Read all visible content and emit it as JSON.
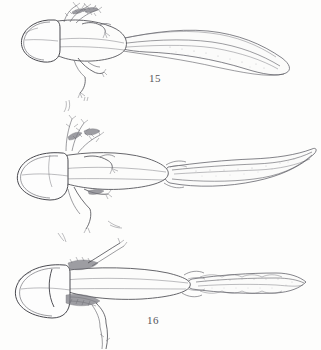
{
  "plate": {
    "title": "Plate of larval amphibian specimens, dorsal view",
    "background_color": "#fdfdfc",
    "ink_color": "#4a4a50",
    "caption_color": "#55555a",
    "width": 321,
    "height": 350
  },
  "figures": [
    {
      "number": "15",
      "caption": "15",
      "subject": "larval salamander, dorsal view",
      "orientation": "head at left, tail extending to upper right",
      "features": [
        "rounded broad head",
        "paired feathery external gills above forelimb",
        "forelimb with digits",
        "hind limb with digits directed downward",
        "long tapering tail with dorsal and ventral fin",
        "stippled shading along tail fin"
      ],
      "head_position": "left",
      "tail_tip": "slender pointed, curving downward to the right"
    },
    {
      "number": "16",
      "caption": "16",
      "subject": "larval salamander, dorsal view",
      "orientation": "head at left, tail extending right and curving upward",
      "features": [
        "broad bilobed head",
        "three pairs of branched external gills",
        "forelimbs with elongated digits",
        "hind limbs trailing downward",
        "elongate body with median dorsal line",
        "long sickle-shaped tail with stippled fin"
      ],
      "head_position": "left",
      "tail_tip": "narrow, upswept and pointed"
    },
    {
      "number": "17",
      "caption": "17",
      "subject": "larval salamander, dorsal view",
      "orientation": "head at left, tail straight to the right",
      "features": [
        "heart-shaped bilobed head",
        "dark shaded gill masses behind head",
        "slender forelimb raised upward",
        "hind limb directed downward below caption",
        "tapering trunk with median line",
        "lance-shaped tail with scalloped fin margin and heavy stipple"
      ],
      "head_position": "left",
      "tail_tip": "lance or spear shaped point"
    }
  ]
}
